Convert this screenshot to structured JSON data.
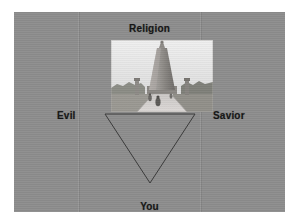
{
  "slide": {
    "background_color": "#8d8d8d",
    "page_background_color": "#ffffff",
    "text_color": "#141414",
    "labels": {
      "top": "Religion",
      "left": "Evil",
      "right": "Savior",
      "bottom": "You"
    },
    "shape": {
      "name": "inverted-triangle",
      "outline_color": "#3b3b3b",
      "orientation": "point-down"
    },
    "photo": {
      "name": "monument-photograph",
      "description": "black-and-white photograph of a tall tapered stone monument at the end of a paved walkway with small figures and trees on either side",
      "sky_color": "#e8e8e8",
      "monument_color": "#8f8c88",
      "path_color": "#cfcccb",
      "foliage_color": "#6d6f66"
    }
  }
}
